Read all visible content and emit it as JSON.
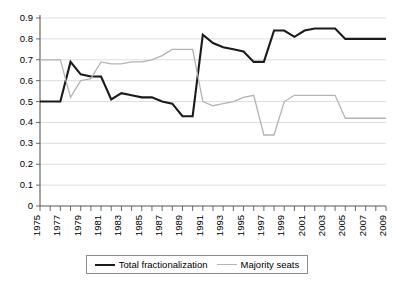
{
  "chart_data": {
    "type": "line",
    "title": "",
    "subtitle": "",
    "xlabel": "",
    "ylabel": "",
    "xlim": [
      1975,
      2009
    ],
    "ylim": [
      0,
      0.9
    ],
    "grid": true,
    "legend_position": "bottom",
    "y_ticks": [
      "0",
      "0.1",
      "0.2",
      "0.3",
      "0.4",
      "0.5",
      "0.6",
      "0.7",
      "0.8",
      "0.9"
    ],
    "y_tick_values": [
      0,
      0.1,
      0.2,
      0.3,
      0.4,
      0.5,
      0.6,
      0.7,
      0.8,
      0.9
    ],
    "x_tick_labels": [
      "1975",
      "1977",
      "1979",
      "1981",
      "1983",
      "1985",
      "1987",
      "1989",
      "1991",
      "1993",
      "1995",
      "1997",
      "1999",
      "2001",
      "2003",
      "2005",
      "2007",
      "2009"
    ],
    "x": [
      1975,
      1976,
      1977,
      1978,
      1979,
      1980,
      1981,
      1982,
      1983,
      1984,
      1985,
      1986,
      1987,
      1988,
      1989,
      1990,
      1991,
      1992,
      1993,
      1994,
      1995,
      1996,
      1997,
      1998,
      1999,
      2000,
      2001,
      2002,
      2003,
      2004,
      2005,
      2006,
      2007,
      2008,
      2009
    ],
    "series": [
      {
        "name": "Total fractionalization",
        "color": "#1a1a1a",
        "values": [
          0.5,
          0.5,
          0.5,
          0.69,
          0.63,
          0.62,
          0.62,
          0.51,
          0.54,
          0.53,
          0.52,
          0.52,
          0.5,
          0.49,
          0.43,
          0.43,
          0.82,
          0.78,
          0.76,
          0.75,
          0.74,
          0.69,
          0.69,
          0.84,
          0.84,
          0.81,
          0.84,
          0.85,
          0.85,
          0.85,
          0.8,
          0.8,
          0.8,
          0.8,
          0.8
        ]
      },
      {
        "name": "Majority seats",
        "color": "#b3b3b3",
        "values": [
          0.7,
          0.7,
          0.7,
          0.52,
          0.6,
          0.61,
          0.69,
          0.68,
          0.68,
          0.69,
          0.69,
          0.7,
          0.72,
          0.75,
          0.75,
          0.75,
          0.5,
          0.48,
          0.49,
          0.5,
          0.52,
          0.53,
          0.34,
          0.34,
          0.5,
          0.53,
          0.53,
          0.53,
          0.53,
          0.53,
          0.42,
          0.42,
          0.42,
          0.42,
          0.42
        ]
      }
    ]
  },
  "legend": {
    "entries": [
      {
        "label": "Total fractionalization",
        "swatch": "black-line-swatch"
      },
      {
        "label": "Majority seats",
        "swatch": "gray-line-swatch"
      }
    ]
  }
}
